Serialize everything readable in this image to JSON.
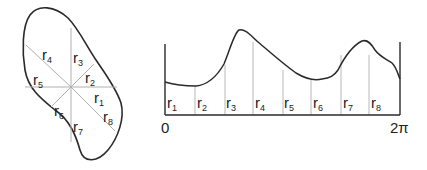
{
  "colors": {
    "outline": "#2a2a2a",
    "ray": "#b0b0b0",
    "divider": "#b8b8b8",
    "text": "#222222"
  },
  "shape": {
    "center": [
      71,
      87
    ],
    "rays": [
      {
        "label": "r",
        "sub": "1",
        "angle_deg": 0
      },
      {
        "label": "r",
        "sub": "2",
        "angle_deg": 45
      },
      {
        "label": "r",
        "sub": "3",
        "angle_deg": 90
      },
      {
        "label": "r",
        "sub": "4",
        "angle_deg": 135
      },
      {
        "label": "r",
        "sub": "5",
        "angle_deg": 180
      },
      {
        "label": "r",
        "sub": "6",
        "angle_deg": 225
      },
      {
        "label": "r",
        "sub": "7",
        "angle_deg": 270
      },
      {
        "label": "r",
        "sub": "8",
        "angle_deg": 315
      }
    ]
  },
  "graph": {
    "x_start_label": "0",
    "x_end_label": "2π",
    "segments": [
      {
        "label": "r",
        "sub": "1"
      },
      {
        "label": "r",
        "sub": "2"
      },
      {
        "label": "r",
        "sub": "3"
      },
      {
        "label": "r",
        "sub": "4"
      },
      {
        "label": "r",
        "sub": "5"
      },
      {
        "label": "r",
        "sub": "6"
      },
      {
        "label": "r",
        "sub": "7"
      },
      {
        "label": "r",
        "sub": "8"
      }
    ]
  }
}
